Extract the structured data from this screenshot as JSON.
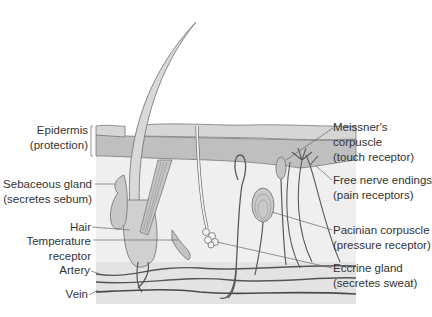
{
  "diagram": {
    "colors": {
      "epidermis_top": "#d4d4d4",
      "epidermis_bottom": "#bdbdbd",
      "dermis": "#ececec",
      "hypodermis": "#e2e2e2",
      "outline": "#6e6e6e",
      "vessel": "#555555",
      "text": "#333333"
    },
    "labels_left": [
      {
        "id": "epidermis",
        "line1": "Epidermis",
        "line2": "(protection)"
      },
      {
        "id": "sebaceous",
        "line1": "Sebaceous gland",
        "line2": "(secretes sebum)"
      },
      {
        "id": "hair",
        "line1": "Hair"
      },
      {
        "id": "temperature",
        "line1": "Temperature",
        "line2": "receptor"
      },
      {
        "id": "artery",
        "line1": "Artery"
      },
      {
        "id": "vein",
        "line1": "Vein"
      }
    ],
    "labels_right": [
      {
        "id": "meissner",
        "line1": "Meissner's",
        "line2": "corpuscle",
        "line3": "(touch receptor)"
      },
      {
        "id": "free-nerve",
        "line1": "Free nerve endings",
        "line2": "(pain receptors)"
      },
      {
        "id": "pacinian",
        "line1": "Pacinian corpuscle",
        "line2": "(pressure receptor)"
      },
      {
        "id": "eccrine",
        "line1": "Eccrine gland",
        "line2": "(secretes sweat)"
      }
    ]
  }
}
